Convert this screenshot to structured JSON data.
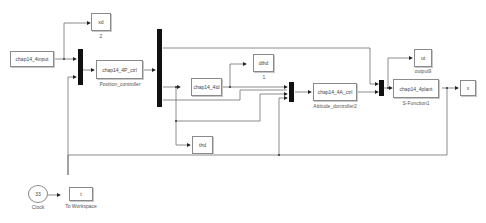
{
  "diagram": {
    "type": "simulink-block-diagram",
    "blocks": {
      "input": {
        "text": "chap14_4input"
      },
      "xd": {
        "text": "xd",
        "caption": "2"
      },
      "position_ctrl": {
        "text": "chap14_4P_ctrl",
        "caption": "Position_controller"
      },
      "td": {
        "text": "chap14_4td"
      },
      "dthd": {
        "text": "dthd",
        "caption": "1"
      },
      "thd": {
        "text": "thd"
      },
      "attitude_ctrl": {
        "text": "chap14_4A_ctrl",
        "caption": "Attitude_dontroller2"
      },
      "ut": {
        "text": "ut",
        "caption": "output9"
      },
      "plant": {
        "text": "chap14_4plant",
        "caption": "S-Function1"
      },
      "x": {
        "text": "x"
      },
      "clock": {
        "text": "33",
        "caption": "Clock"
      },
      "to_workspace": {
        "text": "t",
        "caption": "To Workspace"
      }
    },
    "colors": {
      "line": "#6e6e6e",
      "mux": "#111111",
      "border": "#8a8a8a"
    }
  }
}
